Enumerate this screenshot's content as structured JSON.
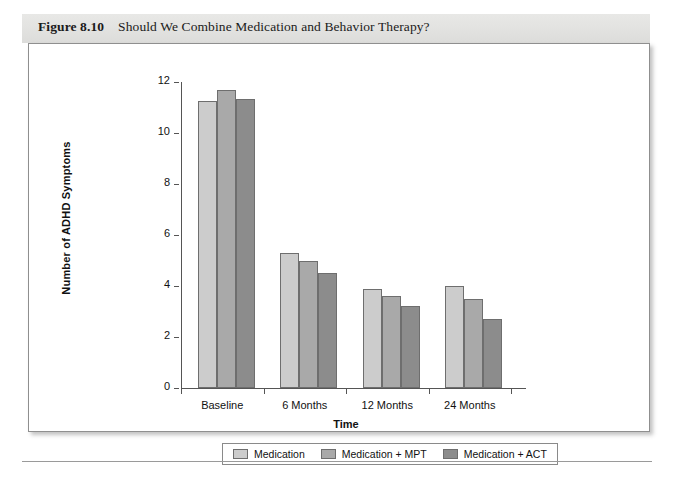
{
  "figure": {
    "number": "Figure 8.10",
    "caption": "Should We Combine Medication and Behavior Therapy?"
  },
  "chart_data": {
    "type": "bar",
    "title": "Should We Combine Medication and Behavior Therapy?",
    "xlabel": "Time",
    "ylabel": "Number of ADHD Symptoms",
    "categories": [
      "Baseline",
      "6 Months",
      "12 Months",
      "24 Months"
    ],
    "series": [
      {
        "name": "Medication",
        "color": "#cccccc",
        "values": [
          11.25,
          5.3,
          3.9,
          4.0
        ]
      },
      {
        "name": "Medication + MPT",
        "color": "#a9a9a9",
        "values": [
          11.7,
          5.0,
          3.6,
          3.5
        ]
      },
      {
        "name": "Medication + ACT",
        "color": "#8c8c8c",
        "values": [
          11.35,
          4.5,
          3.2,
          2.7
        ]
      }
    ],
    "ylim": [
      0,
      12
    ],
    "yticks": [
      0,
      2,
      4,
      6,
      8,
      10,
      12
    ],
    "ytick_labels": [
      "0",
      "2",
      "4",
      "6",
      "8",
      "10",
      "12"
    ],
    "grid": false,
    "legend_position": "bottom"
  }
}
